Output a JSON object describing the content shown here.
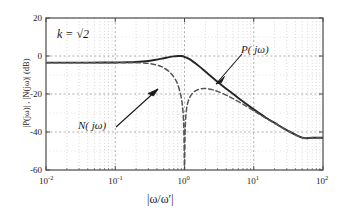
{
  "figure": {
    "name": "bode-magnitude-plot",
    "background": "#ffffff",
    "frame_color": "#4a4a4a"
  },
  "axes": {
    "x": {
      "label": "|ω/ω′|",
      "scale": "log",
      "min": 0.01,
      "max": 100,
      "tick_mantissa": [
        "10",
        "10",
        "10",
        "10",
        "10"
      ],
      "tick_exponents": [
        "-2",
        "-1",
        "0",
        "1",
        "2"
      ],
      "tick_values": [
        0.01,
        0.1,
        1,
        10,
        100
      ]
    },
    "y": {
      "label": "|P(jω)| , |N(jω)|  (dB)",
      "scale": "linear",
      "min": -60,
      "max": 20,
      "ticks": [
        "20",
        "0",
        "-20",
        "-40",
        "-60"
      ],
      "tick_values": [
        20,
        0,
        -20,
        -40,
        -60
      ]
    },
    "grid": "dotted-minor-and-major"
  },
  "annotations": {
    "k_label": "k = √2",
    "p_label": "P( jω)",
    "n_label": "N( jω)"
  },
  "chart_data": {
    "type": "line",
    "title": "",
    "xlabel": "|ω/ω′|",
    "ylabel": "|P(jω)| , |N(jω)|  (dB)",
    "xlim": [
      0.01,
      100
    ],
    "ylim": [
      -60,
      20
    ],
    "xscale": "log",
    "grid": true,
    "legend": "inline-annotations",
    "parameters": {
      "k": 1.4142
    },
    "series": [
      {
        "name": "P( jω)",
        "style": "solid",
        "color": "#262626",
        "x": [
          0.01,
          0.02,
          0.04,
          0.07,
          0.1,
          0.15,
          0.2,
          0.3,
          0.4,
          0.5,
          0.6,
          0.7,
          0.8,
          0.9,
          1.0,
          1.2,
          1.5,
          2.0,
          2.5,
          3.0,
          4.0,
          5.0,
          7.0,
          10.0,
          15.0,
          20.0,
          30.0,
          50.0,
          70.0,
          100.0
        ],
        "y": [
          -3.5,
          -3.5,
          -3.5,
          -3.45,
          -3.4,
          -3.3,
          -3.15,
          -2.6,
          -1.9,
          -1.2,
          -0.6,
          -0.2,
          0.0,
          0.0,
          -0.4,
          -1.8,
          -4.4,
          -8.2,
          -11.2,
          -13.6,
          -17.2,
          -19.9,
          -24.0,
          -28.1,
          -32.5,
          -35.2,
          -39.0,
          -43.0,
          -43.0,
          -43.0
        ]
      },
      {
        "name": "N( jω)",
        "style": "dashed",
        "color": "#555555",
        "x": [
          0.01,
          0.02,
          0.04,
          0.07,
          0.1,
          0.15,
          0.2,
          0.3,
          0.4,
          0.45,
          0.5,
          0.6,
          0.7,
          0.8,
          0.9,
          0.95,
          0.98,
          1.0,
          1.02,
          1.05,
          1.1,
          1.2,
          1.4,
          1.7,
          2.0,
          2.5,
          3.0,
          4.0,
          5.0,
          7.0,
          10.0,
          15.0,
          20.0,
          30.0,
          50.0,
          70.0,
          100.0
        ],
        "y": [
          -3.5,
          -3.5,
          -3.5,
          -3.5,
          -3.5,
          -3.5,
          -3.5,
          -3.9,
          -4.8,
          -5.4,
          -6.2,
          -8.2,
          -11.0,
          -15.0,
          -22.0,
          -29.0,
          -40.0,
          -60.0,
          -40.0,
          -31.0,
          -25.5,
          -21.5,
          -18.6,
          -17.3,
          -17.1,
          -17.7,
          -18.6,
          -20.6,
          -22.4,
          -25.4,
          -28.8,
          -32.8,
          -35.4,
          -39.1,
          -43.0,
          -43.0,
          -43.0
        ]
      }
    ],
    "notch_frequency": 1.0,
    "notch_depth_db": -60
  }
}
